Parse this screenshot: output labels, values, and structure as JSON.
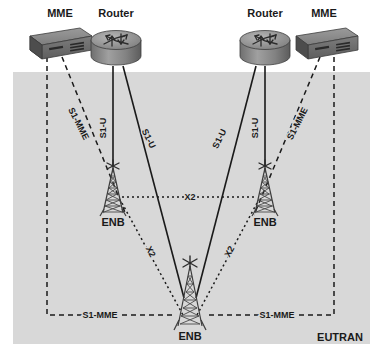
{
  "diagram": {
    "area": {
      "label": "EUTRAN",
      "fill_color": "#d8d8d8",
      "x": 13,
      "y": 72,
      "width": 357,
      "height": 272
    },
    "colors": {
      "line": "#1a1a1a",
      "device_top": "#8a8a8a",
      "device_face": "#6e6e6e",
      "device_side": "#4a4a4a",
      "background": "#ffffff"
    },
    "nodes": [
      {
        "id": "mme-left",
        "type": "mme",
        "label": "MME",
        "x": 60,
        "y": 40,
        "label_x": 60,
        "label_y": 16
      },
      {
        "id": "router-left",
        "type": "router",
        "label": "Router",
        "x": 116,
        "y": 44,
        "label_x": 116,
        "label_y": 16
      },
      {
        "id": "router-right",
        "type": "router",
        "label": "Router",
        "x": 265,
        "y": 44,
        "label_x": 265,
        "label_y": 16
      },
      {
        "id": "mme-right",
        "type": "mme",
        "label": "MME",
        "x": 324,
        "y": 40,
        "label_x": 324,
        "label_y": 16
      },
      {
        "id": "enb-left",
        "type": "enb",
        "label": "ENB",
        "x": 113,
        "y": 196,
        "label_x": 113,
        "label_y": 223
      },
      {
        "id": "enb-right",
        "type": "enb",
        "label": "ENB",
        "x": 265,
        "y": 196,
        "label_x": 265,
        "label_y": 223
      },
      {
        "id": "enb-center",
        "type": "enb",
        "label": "ENB",
        "x": 190,
        "y": 320,
        "label_x": 190,
        "label_y": 346
      }
    ],
    "links": [
      {
        "id": "s1u-left-vertical",
        "label": "S1-U",
        "style": "solid",
        "from": "router-left",
        "to": "enb-left",
        "label_x": 106,
        "label_y": 128,
        "label_rotate": -90
      },
      {
        "id": "s1u-left-diagonal",
        "label": "S1-U",
        "style": "solid",
        "from": "router-left",
        "to": "enb-center",
        "label_x": 146,
        "label_y": 140,
        "label_rotate": 64
      },
      {
        "id": "s1u-right-vertical",
        "label": "S1-U",
        "style": "solid",
        "from": "router-right",
        "to": "enb-right",
        "label_x": 258,
        "label_y": 128,
        "label_rotate": -90
      },
      {
        "id": "s1u-right-diagonal",
        "label": "S1-U",
        "style": "solid",
        "from": "router-right",
        "to": "enb-center",
        "label_x": 222,
        "label_y": 140,
        "label_rotate": -64
      },
      {
        "id": "s1mme-left-diagonal",
        "label": "S1-MME",
        "style": "dashed",
        "from": "mme-left",
        "to": "enb-left",
        "label_x": 76,
        "label_y": 125,
        "label_rotate": 63
      },
      {
        "id": "s1mme-right-diagonal",
        "label": "S1-MME",
        "style": "dashed",
        "from": "mme-right",
        "to": "enb-right",
        "label_x": 300,
        "label_y": 125,
        "label_rotate": -63
      },
      {
        "id": "s1mme-left-bottom",
        "label": "S1-MME",
        "style": "dashed",
        "from": "mme-left",
        "to": "enb-center",
        "label_x": 100,
        "label_y": 313
      },
      {
        "id": "s1mme-right-bottom",
        "label": "S1-MME",
        "style": "dashed",
        "from": "mme-right",
        "to": "enb-center",
        "label_x": 275,
        "label_y": 313
      },
      {
        "id": "x2-horizontal",
        "label": "X2",
        "style": "dotted",
        "from": "enb-left",
        "to": "enb-right",
        "label_x": 190,
        "label_y": 200
      },
      {
        "id": "x2-left-center",
        "label": "X2",
        "style": "dotted",
        "from": "enb-left",
        "to": "enb-center",
        "label_x": 148,
        "label_y": 253,
        "label_rotate": 62
      },
      {
        "id": "x2-right-center",
        "label": "X2",
        "style": "dotted",
        "from": "enb-right",
        "to": "enb-center",
        "label_x": 232,
        "label_y": 253,
        "label_rotate": -62
      }
    ]
  }
}
